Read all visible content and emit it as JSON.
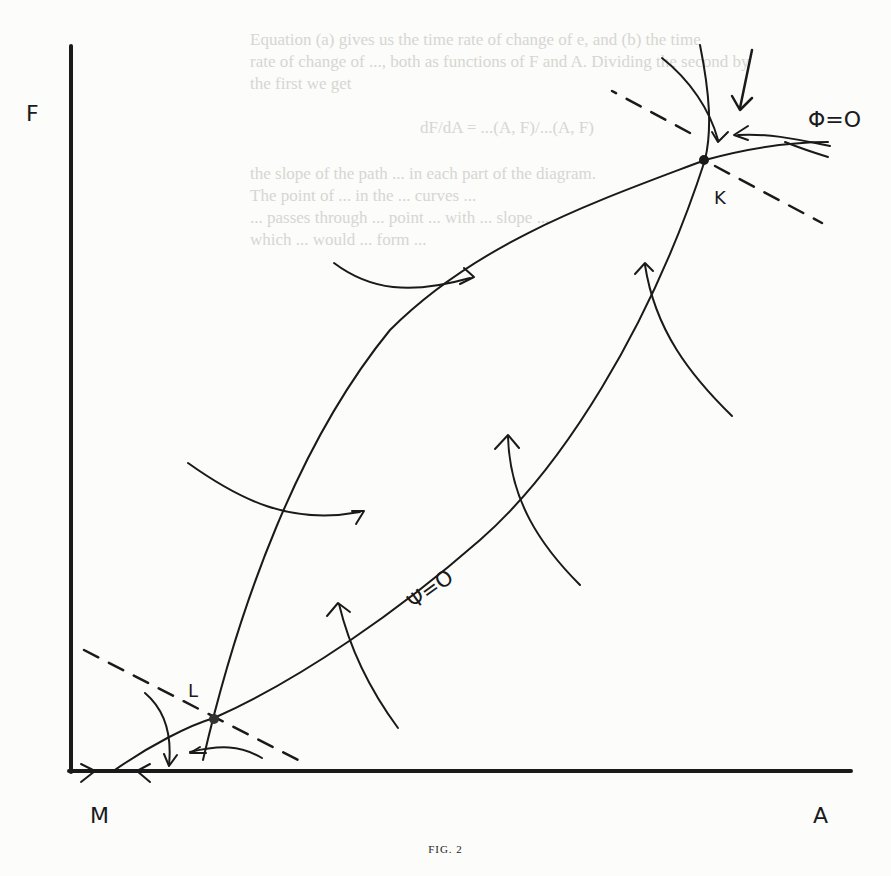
{
  "background_bleed_text": [
    "Equation (a) gives us the time rate of change of e, and (b) the time",
    "rate of change of ..., both as functions of F and A. Dividing the second by",
    "the first we get",
    "dF/dA = ...(A, F)/...(A, F)",
    "the slope of the path ... in each part of the diagram.",
    "The point of ... in the ... curves ...",
    "... passes through ... point ... with ... slope ...",
    "which ... would ... form ..."
  ],
  "figure": {
    "caption": "FIG. 2",
    "axes": {
      "y_label": "F",
      "x_label": "A",
      "origin_label": "M"
    },
    "points": [
      {
        "label": "K",
        "role": "upper equilibrium point"
      },
      {
        "label": "L",
        "role": "lower equilibrium point"
      }
    ],
    "curve_labels": {
      "phi": "Φ=O",
      "psi": "Ψ=O"
    },
    "colors": {
      "ink": "#1a1a1a",
      "paper": "#fcfcfa",
      "bleed": "#d6d6d2"
    }
  }
}
